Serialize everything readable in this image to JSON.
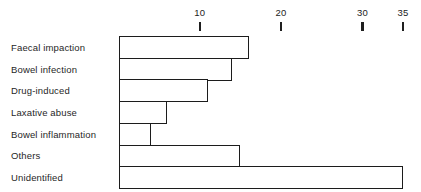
{
  "chart_data": {
    "type": "bar",
    "orientation": "horizontal",
    "title": "",
    "subtitle": "",
    "xlabel": "",
    "ylabel": "",
    "categories": [
      "Faecal impaction",
      "Bowel infection",
      "Drug-induced",
      "Laxative abuse",
      "Bowel inflammation",
      "Others",
      "Unidentified"
    ],
    "values": [
      16,
      14,
      11,
      6,
      4,
      15,
      35
    ],
    "xlim": [
      0,
      35
    ],
    "ylim": null,
    "xticks": [
      10,
      20,
      30,
      35
    ],
    "xticklabels": [
      "10",
      "20",
      "30",
      "35"
    ],
    "grid": false,
    "legend": null,
    "legend_position": "none",
    "annotations": [],
    "bar_fill_color": "#ffffff",
    "bar_edge_color": "#1c1c1c",
    "axis_color": "#1f1f1f",
    "background_color": "#ffffff"
  }
}
